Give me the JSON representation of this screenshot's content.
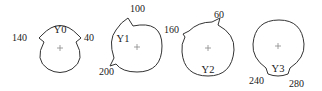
{
  "diagram": {
    "title": "",
    "shapes": [
      {
        "name": "Y0",
        "center": [
          60,
          48
        ],
        "radius": 24,
        "notches": [
          140,
          40
        ],
        "name_pos": [
          60,
          29
        ],
        "labels": [
          {
            "text": "140",
            "x": 14,
            "y": 40
          },
          {
            "text": "40",
            "x": 84,
            "y": 41
          }
        ]
      },
      {
        "name": "Y1",
        "center": [
          137,
          46
        ],
        "radius": 25,
        "notches": [
          100,
          200
        ],
        "name_pos": [
          122,
          42
        ],
        "labels": [
          {
            "text": "100",
            "x": 133,
            "y": 12
          },
          {
            "text": "200",
            "x": 99,
            "y": 74
          }
        ]
      },
      {
        "name": "Y2",
        "center": [
          208,
          48
        ],
        "radius": 26,
        "notches": [
          60,
          160
        ],
        "name_pos": [
          208,
          72
        ],
        "labels": [
          {
            "text": "60",
            "x": 215,
            "y": 18
          },
          {
            "text": "160",
            "x": 165,
            "y": 34
          }
        ]
      },
      {
        "name": "Y3",
        "center": [
          278,
          46
        ],
        "radius": 26,
        "notches": [
          240,
          280
        ],
        "name_pos": [
          278,
          72
        ],
        "labels": [
          {
            "text": "240",
            "x": 250,
            "y": 83
          },
          {
            "text": "280",
            "x": 290,
            "y": 86
          }
        ]
      }
    ],
    "colors": {
      "stroke": "#333333",
      "center_mark": "#888888",
      "text": "#222222",
      "background": "#ffffff"
    }
  }
}
